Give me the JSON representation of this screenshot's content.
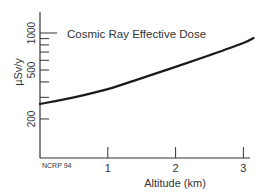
{
  "chart_data": {
    "type": "line",
    "title": "Cosmic Ray Effective Dose",
    "xlabel": "Altitude (km)",
    "ylabel": "µSv/y",
    "source_note": "NCRP 94",
    "yscale": "log",
    "xlim": [
      0,
      3.15
    ],
    "ylim": [
      130,
      1400
    ],
    "x_ticks": [
      1,
      2,
      3
    ],
    "x_tick_labels": [
      "1",
      "2",
      "3"
    ],
    "y_labeled_ticks": [
      200,
      500,
      1000
    ],
    "y_tick_labels": [
      "200",
      "500",
      "1000"
    ],
    "y_minor_ticks": [
      300,
      400,
      600,
      700,
      800,
      900
    ],
    "grid": false,
    "legend": null,
    "series": [
      {
        "name": "Cosmic Ray Effective Dose",
        "x": [
          0,
          0.5,
          1,
          1.5,
          2,
          2.5,
          3,
          3.15
        ],
        "values": [
          265,
          300,
          350,
          430,
          530,
          660,
          830,
          910
        ]
      }
    ]
  },
  "colors": {
    "axis": "#333333",
    "line": "#1a1a1a",
    "text": "#333333",
    "background": "#ffffff"
  }
}
